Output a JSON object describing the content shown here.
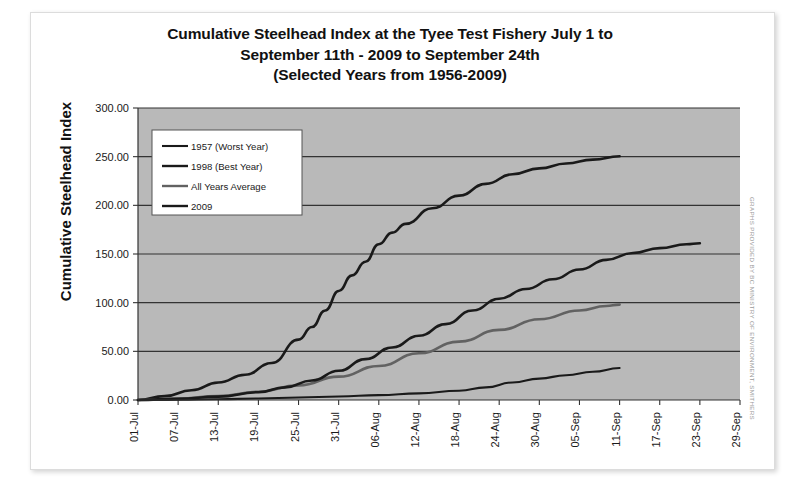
{
  "figure": {
    "title_lines": [
      "Cumulative Steelhead Index at the Tyee Test Fishery July 1 to",
      "September 11th - 2009 to September 24th",
      "(Selected Years from 1956-2009)"
    ],
    "credit": "GRAPHS PROVIDED BY BC MINISTRY OF ENVIRONMENT, SMITHERS",
    "plot_background": "#b9b9b9",
    "gridline_color": "#333333",
    "page_background": "#ffffff"
  },
  "chart_data": {
    "type": "line",
    "title": "Cumulative Steelhead Index at the Tyee Test Fishery July 1 to September 11th - 2009 to September 24th (Selected Years from 1956-2009)",
    "xlabel": "",
    "ylabel": "Cumulative Steelhead Index",
    "ylim": [
      0,
      300
    ],
    "yticks": [
      0,
      50,
      100,
      150,
      200,
      250,
      300
    ],
    "ytick_labels": [
      "0.00",
      "50.00",
      "100.00",
      "150.00",
      "200.00",
      "250.00",
      "300.00"
    ],
    "xtick_labels": [
      "01-Jul",
      "07-Jul",
      "13-Jul",
      "19-Jul",
      "25-Jul",
      "31-Jul",
      "06-Aug",
      "12-Aug",
      "18-Aug",
      "24-Aug",
      "30-Aug",
      "05-Sep",
      "11-Sep",
      "17-Sep",
      "23-Sep",
      "29-Sep"
    ],
    "x_start": "01-Jul",
    "x_end": "29-Sep",
    "x_day_count": 91,
    "grid": true,
    "legend_position": "upper left",
    "series": [
      {
        "name": "1957 (Worst Year)",
        "color": "#1a1a1a",
        "width": 2.1,
        "x_days": [
          0,
          6,
          12,
          18,
          24,
          30,
          36,
          42,
          48,
          52,
          56,
          60,
          64,
          68,
          72
        ],
        "values": [
          0.0,
          0.3,
          0.8,
          1.6,
          2.6,
          3.6,
          5.0,
          6.8,
          9.5,
          13.0,
          18.0,
          22.0,
          25.5,
          29.0,
          32.8
        ]
      },
      {
        "name": "1998 (Best Year)",
        "color": "#1a1a1a",
        "width": 2.6,
        "x_days": [
          0,
          4,
          8,
          12,
          16,
          20,
          24,
          26,
          28,
          30,
          32,
          34,
          36,
          38,
          40,
          44,
          48,
          52,
          56,
          60,
          64,
          68,
          72
        ],
        "values": [
          0.0,
          4.0,
          10.0,
          18.0,
          26.0,
          38.0,
          62.0,
          75.0,
          92.0,
          112.0,
          128.0,
          142.0,
          160.0,
          172.0,
          181.0,
          197.0,
          210.0,
          222.0,
          232.0,
          238.0,
          243.0,
          247.0,
          250.5
        ]
      },
      {
        "name": "All Years Average",
        "color": "#626262",
        "width": 2.6,
        "x_days": [
          0,
          6,
          12,
          18,
          24,
          30,
          36,
          42,
          48,
          54,
          60,
          66,
          70,
          72
        ],
        "values": [
          0.0,
          1.5,
          4.0,
          8.5,
          15.0,
          24.0,
          35.0,
          48.0,
          60.0,
          72.0,
          83.0,
          92.0,
          96.5,
          98.0
        ]
      },
      {
        "name": "2009",
        "color": "#1a1a1a",
        "width": 2.6,
        "x_days": [
          0,
          6,
          12,
          18,
          22,
          26,
          30,
          34,
          38,
          42,
          46,
          50,
          54,
          58,
          62,
          66,
          70,
          74,
          78,
          82,
          84
        ],
        "values": [
          0.0,
          1.2,
          3.5,
          8.0,
          13.0,
          20.0,
          30.0,
          42.0,
          54.0,
          66.0,
          78.0,
          92.0,
          104.0,
          114.0,
          124.0,
          134.0,
          144.0,
          151.0,
          156.0,
          160.0,
          161.0
        ]
      }
    ]
  },
  "legend": {
    "entries": [
      {
        "label": "1957 (Worst Year)",
        "color": "#1a1a1a"
      },
      {
        "label": "1998 (Best Year)",
        "color": "#1a1a1a"
      },
      {
        "label": "All Years Average",
        "color": "#626262"
      },
      {
        "label": "2009",
        "color": "#1a1a1a"
      }
    ]
  }
}
